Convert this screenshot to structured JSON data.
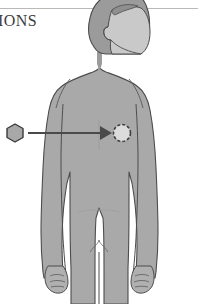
{
  "page": {
    "title_fragment": "IONS",
    "background_color": "#ffffff"
  },
  "rule": {
    "name": "top-horizontal-rule",
    "color": "#b9b9b9"
  },
  "figure": {
    "label": "adult male body front view with head in profile",
    "body_fill": "#a9a9a9",
    "outline_color": "#4d4d4d",
    "hair_fill": "#9b9b9b",
    "face_fill": "#c9c9c9"
  },
  "annotation": {
    "marker": {
      "name": "hexagon-marker",
      "shape": "hexagon",
      "fill": "#a8a8a8",
      "outline": "#3a3a3a",
      "center_x": 15,
      "center_y": 133
    },
    "arrow": {
      "name": "pointer-arrow",
      "color": "#4a4a4a",
      "from_x": 28,
      "to_x": 104,
      "y": 133
    },
    "target_site": {
      "name": "injection-site-circle",
      "shape": "dashed-circle",
      "fill": "#d8d8d8",
      "outline": "#3f3f3f",
      "center_x": 122,
      "center_y": 133,
      "radius": 9
    }
  }
}
